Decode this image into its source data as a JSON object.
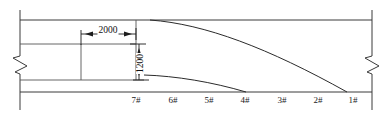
{
  "drawing": {
    "type": "engineering-elevation-drawing",
    "width": 391,
    "height": 118,
    "background_color": "#ffffff",
    "line_color": "#3a3a3a"
  },
  "dimensions": {
    "horizontal": {
      "label": "2000",
      "unit_implied": "mm",
      "orientation": "horizontal",
      "x_start": 81,
      "x_end": 136,
      "y": 34
    },
    "vertical": {
      "label": "1200",
      "unit_implied": "mm",
      "orientation": "vertical",
      "x": 139,
      "y_start": 44,
      "y_end": 80
    }
  },
  "pier_labels": [
    {
      "label": "7#",
      "x": 136
    },
    {
      "label": "6#",
      "x": 173
    },
    {
      "label": "5#",
      "x": 209
    },
    {
      "label": "4#",
      "x": 245
    },
    {
      "label": "3#",
      "x": 282
    },
    {
      "label": "2#",
      "x": 318
    },
    {
      "label": "1#",
      "x": 353
    }
  ],
  "label_row": {
    "baseline_y": 101,
    "count": 7
  },
  "geometry": {
    "top_line_y": 20,
    "deck_upper_y": 44,
    "deck_lower_y": 80,
    "base_line_y": 92,
    "left_edge_x": 20,
    "right_edge_x": 372,
    "section_x": 136,
    "box_left_x": 20,
    "box_right_x": 81,
    "upper_curve": {
      "start_x": 150,
      "start_y": 20,
      "end_x": 347,
      "end_y": 92,
      "description": "upper haunch curve tangent to top line descending to base line near pier 1#"
    },
    "lower_curve": {
      "start_x": 144,
      "start_y": 75,
      "end_x": 246,
      "end_y": 92,
      "description": "lower haunch curve tangent to deck lower line descending to base line near pier 4#"
    },
    "break_symbols": [
      {
        "side": "left",
        "x": 20,
        "y_center": 62
      },
      {
        "side": "right",
        "x": 372,
        "y_center": 62
      }
    ]
  }
}
